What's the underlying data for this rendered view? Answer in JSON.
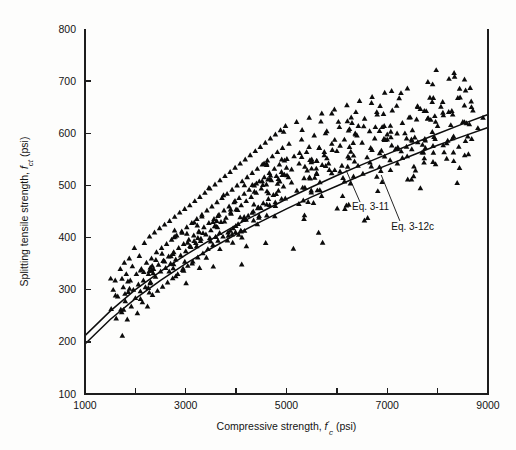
{
  "chart_data": {
    "type": "scatter",
    "title": "",
    "xlabel": "Compressive strength, f'c (psi)",
    "ylabel": "Splitting tensile strength, fct (psi)",
    "xlabel_parts": {
      "prefix": "Compressive strength, ",
      "symbol": "f",
      "sub": "c",
      "prime": "'",
      "suffix": " (psi)"
    },
    "ylabel_parts": {
      "prefix": "Splitting tensile strength, ",
      "symbol": "f",
      "sub": "ct",
      "suffix": " (psi)"
    },
    "xlim": [
      1000,
      9000
    ],
    "ylim": [
      100,
      800
    ],
    "xticks": [
      1000,
      2000,
      3000,
      4000,
      5000,
      6000,
      7000,
      8000,
      9000
    ],
    "xtick_labels": [
      "1000",
      "",
      "3000",
      "",
      "5000",
      "",
      "7000",
      "",
      "9000"
    ],
    "yticks": [
      100,
      200,
      300,
      400,
      500,
      600,
      700,
      800
    ],
    "ytick_labels": [
      "100",
      "200",
      "300",
      "400",
      "500",
      "600",
      "700",
      "800"
    ],
    "grid": false,
    "legend": "none",
    "marker": "triangle-up",
    "marker_color": "#0b0b0b",
    "marker_size_px": 5.6,
    "annotations": [
      {
        "label": "Eq. 3-11",
        "text_x": 6300,
        "text_y": 452,
        "leader_from": [
          6460,
          468
        ],
        "leader_to": [
          6180,
          530
        ],
        "curve": "eq_3_11"
      },
      {
        "label": "Eq. 3-12c",
        "text_x": 7080,
        "text_y": 415,
        "leader_from": [
          7250,
          432
        ],
        "leader_to": [
          6880,
          520
        ],
        "curve": "eq_3_12c"
      }
    ],
    "series": [
      {
        "name": "Eq. 3-11",
        "type": "curve",
        "description": "Lower fitted curve, fct = 6.7*sqrt(f'c)",
        "coefficient": 6.7,
        "x": [
          1000,
          1500,
          2000,
          2500,
          3000,
          3500,
          4000,
          4500,
          5000,
          5500,
          6000,
          6500,
          7000,
          7500,
          8000,
          8500,
          9000
        ],
        "y": [
          212,
          259,
          300,
          335,
          367,
          396,
          424,
          449,
          474,
          497,
          519,
          540,
          560,
          580,
          599,
          618,
          636
        ]
      },
      {
        "name": "Eq. 3-12c",
        "type": "curve",
        "description": "Upper fitted curve, slightly higher at low f'c",
        "coefficient": 6.4,
        "x": [
          1000,
          1500,
          2000,
          2500,
          3000,
          3500,
          4000,
          4500,
          5000,
          5500,
          6000,
          6500,
          7000,
          7500,
          8000,
          8500,
          9000
        ],
        "y": [
          196,
          243,
          283,
          318,
          350,
          379,
          406,
          431,
          455,
          478,
          499,
          520,
          539,
          558,
          577,
          594,
          611
        ]
      },
      {
        "name": "Test data",
        "type": "scatter",
        "n_points": 560,
        "points": [
          [
            1520,
            263
          ],
          [
            1560,
            300
          ],
          [
            1600,
            318
          ],
          [
            1620,
            245
          ],
          [
            1650,
            287
          ],
          [
            1700,
            340
          ],
          [
            1710,
            262
          ],
          [
            1740,
            212
          ],
          [
            1760,
            305
          ],
          [
            1780,
            352
          ],
          [
            1800,
            278
          ],
          [
            1820,
            330
          ],
          [
            1840,
            243
          ],
          [
            1860,
            296
          ],
          [
            1880,
            360
          ],
          [
            1900,
            318
          ],
          [
            1920,
            268
          ],
          [
            1940,
            345
          ],
          [
            1960,
            300
          ],
          [
            1980,
            380
          ],
          [
            2000,
            284
          ],
          [
            2020,
            330
          ],
          [
            2040,
            255
          ],
          [
            2060,
            310
          ],
          [
            2080,
            365
          ],
          [
            2100,
            297
          ],
          [
            2120,
            340
          ],
          [
            2140,
            276
          ],
          [
            2160,
            318
          ],
          [
            2180,
            390
          ],
          [
            2200,
            305
          ],
          [
            2220,
            352
          ],
          [
            2240,
            268
          ],
          [
            2260,
            330
          ],
          [
            2280,
            402
          ],
          [
            2300,
            315
          ],
          [
            2320,
            360
          ],
          [
            2340,
            290
          ],
          [
            2360,
            340
          ],
          [
            2380,
            410
          ],
          [
            2400,
            325
          ],
          [
            2420,
            372
          ],
          [
            2440,
            298
          ],
          [
            2460,
            348
          ],
          [
            2480,
            418
          ],
          [
            2500,
            335
          ],
          [
            2520,
            380
          ],
          [
            2540,
            306
          ],
          [
            2560,
            356
          ],
          [
            2580,
            425
          ],
          [
            2600,
            342
          ],
          [
            2620,
            388
          ],
          [
            2640,
            314
          ],
          [
            2660,
            364
          ],
          [
            2680,
            432
          ],
          [
            2700,
            350
          ],
          [
            2720,
            396
          ],
          [
            2740,
            322
          ],
          [
            2760,
            372
          ],
          [
            2780,
            440
          ],
          [
            2800,
            358
          ],
          [
            2820,
            404
          ],
          [
            2840,
            330
          ],
          [
            2860,
            380
          ],
          [
            2880,
            448
          ],
          [
            2900,
            366
          ],
          [
            2920,
            412
          ],
          [
            2940,
            338
          ],
          [
            2960,
            388
          ],
          [
            2980,
            455
          ],
          [
            3000,
            374
          ],
          [
            3020,
            420
          ],
          [
            3040,
            346
          ],
          [
            3060,
            396
          ],
          [
            3080,
            462
          ],
          [
            3100,
            382
          ],
          [
            3120,
            428
          ],
          [
            3140,
            354
          ],
          [
            3160,
            404
          ],
          [
            3180,
            470
          ],
          [
            3200,
            390
          ],
          [
            3220,
            436
          ],
          [
            3240,
            362
          ],
          [
            3260,
            412
          ],
          [
            3280,
            478
          ],
          [
            3300,
            398
          ],
          [
            3320,
            444
          ],
          [
            3340,
            370
          ],
          [
            3360,
            420
          ],
          [
            3380,
            486
          ],
          [
            3400,
            406
          ],
          [
            3420,
            452
          ],
          [
            3440,
            378
          ],
          [
            3460,
            428
          ],
          [
            3480,
            494
          ],
          [
            3500,
            414
          ],
          [
            3520,
            460
          ],
          [
            3540,
            386
          ],
          [
            3560,
            436
          ],
          [
            3580,
            502
          ],
          [
            3600,
            422
          ],
          [
            3620,
            468
          ],
          [
            3640,
            394
          ],
          [
            3660,
            444
          ],
          [
            3680,
            510
          ],
          [
            3700,
            430
          ],
          [
            3720,
            476
          ],
          [
            3740,
            402
          ],
          [
            3760,
            452
          ],
          [
            3780,
            518
          ],
          [
            3800,
            438
          ],
          [
            3820,
            484
          ],
          [
            3840,
            410
          ],
          [
            3860,
            460
          ],
          [
            3880,
            526
          ],
          [
            3900,
            446
          ],
          [
            3920,
            492
          ],
          [
            3940,
            418
          ],
          [
            3960,
            468
          ],
          [
            3980,
            534
          ],
          [
            4000,
            454
          ],
          [
            4020,
            500
          ],
          [
            4040,
            426
          ],
          [
            4060,
            476
          ],
          [
            4080,
            542
          ],
          [
            4100,
            462
          ],
          [
            4120,
            508
          ],
          [
            4140,
            434
          ],
          [
            4160,
            484
          ],
          [
            4180,
            550
          ],
          [
            4200,
            470
          ],
          [
            4220,
            516
          ],
          [
            4240,
            442
          ],
          [
            4260,
            492
          ],
          [
            4280,
            558
          ],
          [
            4300,
            478
          ],
          [
            4320,
            524
          ],
          [
            4340,
            450
          ],
          [
            4360,
            500
          ],
          [
            4380,
            566
          ],
          [
            4400,
            486
          ],
          [
            4420,
            532
          ],
          [
            4440,
            458
          ],
          [
            4460,
            508
          ],
          [
            4480,
            574
          ],
          [
            4500,
            494
          ],
          [
            4520,
            540
          ],
          [
            4540,
            466
          ],
          [
            4560,
            516
          ],
          [
            4580,
            582
          ],
          [
            4600,
            502
          ],
          [
            4620,
            548
          ],
          [
            4640,
            474
          ],
          [
            4660,
            524
          ],
          [
            4680,
            590
          ],
          [
            4700,
            510
          ],
          [
            4720,
            556
          ],
          [
            4740,
            482
          ],
          [
            4760,
            532
          ],
          [
            4780,
            598
          ],
          [
            4800,
            518
          ],
          [
            4820,
            564
          ],
          [
            4840,
            490
          ],
          [
            4860,
            540
          ],
          [
            4880,
            606
          ],
          [
            4900,
            526
          ],
          [
            4920,
            572
          ],
          [
            4940,
            498
          ],
          [
            4960,
            548
          ],
          [
            4980,
            614
          ],
          [
            5000,
            534
          ],
          [
            5050,
            580
          ],
          [
            5100,
            506
          ],
          [
            5150,
            556
          ],
          [
            5200,
            622
          ],
          [
            5250,
            542
          ],
          [
            5300,
            588
          ],
          [
            5350,
            514
          ],
          [
            5400,
            564
          ],
          [
            5450,
            630
          ],
          [
            5500,
            550
          ],
          [
            5550,
            596
          ],
          [
            5600,
            522
          ],
          [
            5650,
            572
          ],
          [
            5700,
            638
          ],
          [
            5750,
            558
          ],
          [
            5800,
            604
          ],
          [
            5850,
            530
          ],
          [
            5900,
            580
          ],
          [
            5950,
            646
          ],
          [
            6000,
            566
          ],
          [
            6050,
            612
          ],
          [
            6100,
            538
          ],
          [
            6150,
            588
          ],
          [
            6200,
            654
          ],
          [
            6250,
            574
          ],
          [
            6300,
            620
          ],
          [
            6350,
            546
          ],
          [
            6400,
            596
          ],
          [
            6450,
            662
          ],
          [
            6500,
            582
          ],
          [
            6550,
            628
          ],
          [
            6600,
            554
          ],
          [
            6650,
            604
          ],
          [
            6700,
            670
          ],
          [
            6750,
            590
          ],
          [
            6800,
            636
          ],
          [
            6850,
            562
          ],
          [
            6900,
            612
          ],
          [
            6950,
            678
          ],
          [
            7000,
            598
          ],
          [
            7100,
            644
          ],
          [
            7200,
            570
          ],
          [
            7300,
            620
          ],
          [
            7400,
            686
          ],
          [
            7500,
            606
          ],
          [
            7600,
            652
          ],
          [
            7700,
            578
          ],
          [
            7800,
            628
          ],
          [
            7900,
            694
          ],
          [
            8000,
            614
          ],
          [
            8100,
            660
          ],
          [
            8200,
            586
          ],
          [
            8300,
            636
          ],
          [
            8400,
            668
          ],
          [
            8500,
            622
          ],
          [
            8600,
            594
          ],
          [
            8700,
            644
          ],
          [
            8800,
            610
          ],
          [
            8900,
            630
          ]
        ]
      }
    ]
  },
  "figure": {
    "plot_left_px": 85,
    "plot_right_px": 488,
    "plot_top_px": 29,
    "plot_bottom_px": 394
  }
}
